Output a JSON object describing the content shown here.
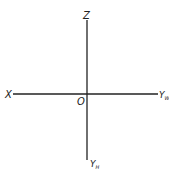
{
  "diagram": {
    "type": "projection-axes",
    "origin_label": "O",
    "axes": {
      "top": {
        "label": "Z"
      },
      "left": {
        "label": "X"
      },
      "right": {
        "label": "Y",
        "subscript": "W"
      },
      "bottom": {
        "label": "Y",
        "subscript": "H"
      }
    },
    "colors": {
      "line": "#222222",
      "background": "#ffffff"
    }
  }
}
